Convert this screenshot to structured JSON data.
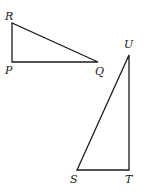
{
  "diagram": {
    "type": "geometry",
    "stroke_color": "#1a1a1a",
    "triangles": [
      {
        "name": "PQR",
        "right_angle_at": "P",
        "vertices": [
          {
            "label": "R",
            "x": 12,
            "y": 23,
            "label_x": 5,
            "label_y": 20
          },
          {
            "label": "P",
            "x": 12,
            "y": 62,
            "label_x": 5,
            "label_y": 74
          },
          {
            "label": "Q",
            "x": 98,
            "y": 62,
            "label_x": 95,
            "label_y": 75
          }
        ]
      },
      {
        "name": "STU",
        "right_angle_at": "T",
        "vertices": [
          {
            "label": "U",
            "x": 129,
            "y": 55,
            "label_x": 124,
            "label_y": 48
          },
          {
            "label": "T",
            "x": 129,
            "y": 170,
            "label_x": 125,
            "label_y": 183
          },
          {
            "label": "S",
            "x": 77,
            "y": 170,
            "label_x": 70,
            "label_y": 183
          }
        ]
      }
    ]
  }
}
